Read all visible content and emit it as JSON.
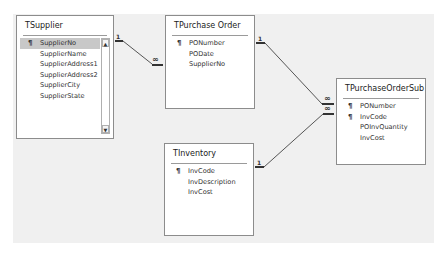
{
  "diagram": {
    "tables": [
      {
        "id": "tsupplier",
        "title": "TSupplier",
        "fields": [
          {
            "name": "SupplierNo",
            "key": true,
            "selected": true
          },
          {
            "name": "SupplierName",
            "key": false
          },
          {
            "name": "SupplierAddress1",
            "key": false
          },
          {
            "name": "SupplierAddress2",
            "key": false
          },
          {
            "name": "SupplierCity",
            "key": false
          },
          {
            "name": "SupplierState",
            "key": false
          }
        ],
        "scrollbar": {
          "up": "▲",
          "down": "▼"
        }
      },
      {
        "id": "tpurchaseorder",
        "title": "TPurchase Order",
        "fields": [
          {
            "name": "PONumber",
            "key": true
          },
          {
            "name": "PODate",
            "key": false
          },
          {
            "name": "SupplierNo",
            "key": false
          }
        ]
      },
      {
        "id": "tpurchaseordersub",
        "title": "TPurchaseOrderSub",
        "fields": [
          {
            "name": "PONumber",
            "key": true
          },
          {
            "name": "InvCode",
            "key": true
          },
          {
            "name": "POInvQuantity",
            "key": false
          },
          {
            "name": "InvCost",
            "key": false
          }
        ]
      },
      {
        "id": "tinventory",
        "title": "TInventory",
        "fields": [
          {
            "name": "InvCode",
            "key": true
          },
          {
            "name": "InvDescription",
            "key": false
          },
          {
            "name": "InvCost",
            "key": false
          }
        ]
      }
    ],
    "relationships": [
      {
        "from": "TSupplier.SupplierNo",
        "to": "TPurchase Order.SupplierNo",
        "one": "1",
        "many": "∞"
      },
      {
        "from": "TPurchase Order.PONumber",
        "to": "TPurchaseOrderSub.PONumber",
        "one": "1",
        "many": "∞"
      },
      {
        "from": "TInventory.InvCode",
        "to": "TPurchaseOrderSub.InvCode",
        "one": "1",
        "many": "∞"
      }
    ],
    "key_glyph": "🔑"
  }
}
